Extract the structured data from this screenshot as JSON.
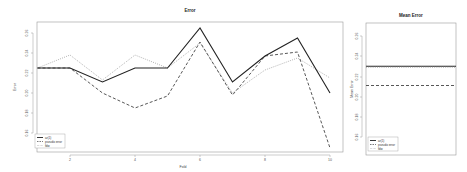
{
  "chart_data": [
    {
      "type": "line",
      "title": "Error",
      "xlabel": "Fold",
      "ylabel": "Error",
      "x": [
        1,
        2,
        3,
        4,
        5,
        6,
        7,
        8,
        9,
        10
      ],
      "xticks": [
        2,
        4,
        6,
        8,
        10
      ],
      "yticks": [
        0.16,
        0.18,
        0.2,
        0.22,
        0.24,
        0.26
      ],
      "xlim": [
        1,
        10
      ],
      "ylim": [
        0.14,
        0.27
      ],
      "grid": false,
      "legend_position": "bottom-left",
      "series": [
        {
          "name": "ar(1)",
          "style": "solid",
          "color": "#222222",
          "values": [
            0.225,
            0.225,
            0.211,
            0.225,
            0.225,
            0.265,
            0.211,
            0.237,
            0.255,
            0.2
          ]
        },
        {
          "name": "pseudo error",
          "style": "dashed",
          "color": "#444444",
          "values": [
            0.225,
            0.225,
            0.2,
            0.185,
            0.197,
            0.251,
            0.198,
            0.237,
            0.241,
            0.145
          ]
        },
        {
          "name": "fdw",
          "style": "dotted",
          "color": "#aaaaaa",
          "values": [
            0.225,
            0.238,
            0.213,
            0.238,
            0.225,
            0.25,
            0.2,
            0.223,
            0.235,
            0.215
          ]
        }
      ]
    },
    {
      "type": "line",
      "title": "Mean Error",
      "xlabel": "",
      "ylabel": "Mean Error",
      "yticks": [
        0.16,
        0.18,
        0.2,
        0.22,
        0.24,
        0.26
      ],
      "ylim": [
        0.14,
        0.27
      ],
      "grid": false,
      "legend_position": "bottom-left",
      "series": [
        {
          "name": "ar(1)",
          "style": "solid",
          "color": "#222222",
          "values": [
            0.23
          ]
        },
        {
          "name": "pseudo error",
          "style": "dashed",
          "color": "#444444",
          "values": [
            0.211
          ]
        },
        {
          "name": "fdw",
          "style": "dotted",
          "color": "#aaaaaa",
          "values": [
            0.229
          ]
        }
      ]
    }
  ],
  "main": {
    "title": "Error",
    "xlabel": "Fold",
    "ylabel": "Error",
    "xticks": [
      "2",
      "4",
      "6",
      "8",
      "10"
    ],
    "yticks": [
      "0.26",
      "0.24",
      "0.22",
      "0.20",
      "0.18",
      "0.16"
    ],
    "legend": [
      "ar(1)",
      "pseudo error",
      "fdw"
    ]
  },
  "side": {
    "title": "Mean Error",
    "ylabel": "Mean Error",
    "yticks": [
      "0.26",
      "0.24",
      "0.22",
      "0.20",
      "0.18",
      "0.16"
    ],
    "legend": [
      "ar(1)",
      "pseudo error",
      "fdw"
    ]
  }
}
